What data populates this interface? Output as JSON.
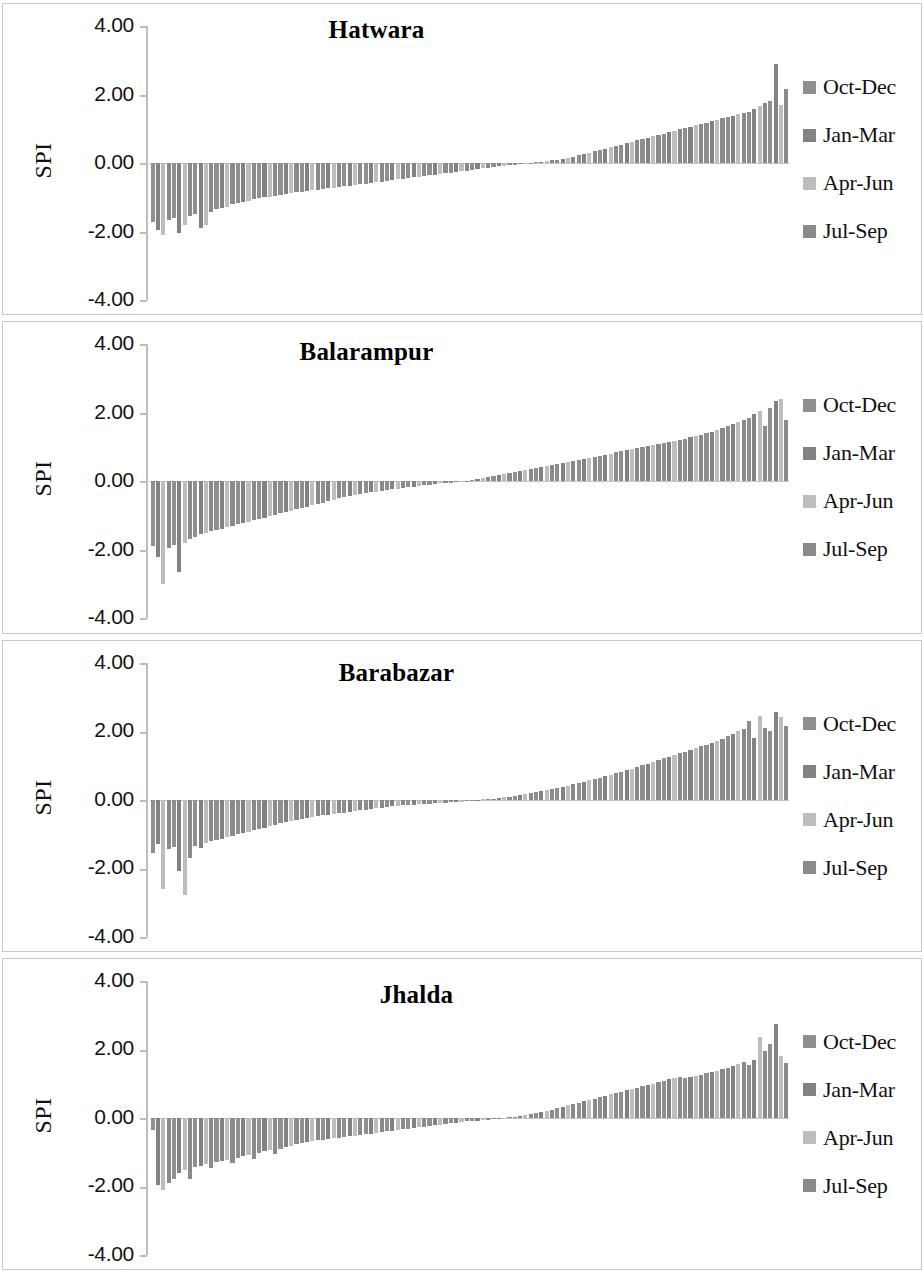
{
  "figure": {
    "background": "#ffffff",
    "panel_border_color": "#c9c9c9",
    "axis_color": "#bdbdbd",
    "panel_count": 4
  },
  "legend": {
    "position": "right",
    "items": [
      {
        "label": "Oct-Dec",
        "color": "#8f8f8f"
      },
      {
        "label": "Jan-Mar",
        "color": "#828282"
      },
      {
        "label": "Apr-Jun",
        "color": "#bdbdbd"
      },
      {
        "label": "Jul-Sep",
        "color": "#8a8a8a"
      }
    ]
  },
  "axis": {
    "ylabel": "SPI",
    "ticks": [
      "4.00",
      "2.00",
      "0.00",
      "-2.00",
      "-4.00"
    ],
    "ymin": -4,
    "ymax": 4
  },
  "chart_data": [
    {
      "type": "bar",
      "title": "Hatwara",
      "xlabel": "",
      "ylabel": "SPI",
      "ylim": [
        -4,
        4
      ],
      "grid": false,
      "legend_position": "right",
      "yticks": [
        4,
        2,
        0,
        -2,
        -4
      ],
      "ytick_labels": [
        "4.00",
        "2.00",
        "0.00",
        "-2.00",
        "-4.00"
      ],
      "series_names": [
        "Oct-Dec",
        "Jan-Mar",
        "Apr-Jun",
        "Jul-Sep"
      ],
      "note": "Sorted SPI values per season, ascending across the x axis",
      "values": [
        -1.72,
        -1.95,
        -2.1,
        -1.66,
        -1.6,
        -2.05,
        -1.82,
        -1.55,
        -1.48,
        -1.9,
        -1.8,
        -1.42,
        -1.35,
        -1.3,
        -1.28,
        -1.2,
        -1.18,
        -1.14,
        -1.1,
        -1.05,
        -1.02,
        -1.0,
        -0.98,
        -0.95,
        -0.93,
        -0.9,
        -0.88,
        -0.86,
        -0.84,
        -0.82,
        -0.8,
        -0.78,
        -0.76,
        -0.74,
        -0.72,
        -0.7,
        -0.68,
        -0.66,
        -0.64,
        -0.62,
        -0.6,
        -0.58,
        -0.56,
        -0.54,
        -0.52,
        -0.5,
        -0.48,
        -0.46,
        -0.44,
        -0.42,
        -0.4,
        -0.38,
        -0.36,
        -0.34,
        -0.32,
        -0.3,
        -0.28,
        -0.26,
        -0.24,
        -0.22,
        -0.2,
        -0.18,
        -0.16,
        -0.14,
        -0.12,
        -0.1,
        -0.08,
        -0.06,
        -0.05,
        -0.04,
        -0.03,
        -0.02,
        0.02,
        0.04,
        0.06,
        0.08,
        0.1,
        0.13,
        0.16,
        0.19,
        0.22,
        0.26,
        0.3,
        0.34,
        0.38,
        0.42,
        0.46,
        0.5,
        0.54,
        0.58,
        0.62,
        0.66,
        0.7,
        0.74,
        0.78,
        0.82,
        0.86,
        0.9,
        0.94,
        0.98,
        1.02,
        1.06,
        1.1,
        1.14,
        1.18,
        1.22,
        1.26,
        1.3,
        1.34,
        1.38,
        1.42,
        1.46,
        1.5,
        1.58,
        1.66,
        1.74,
        1.82,
        2.9,
        1.7,
        2.15
      ]
    },
    {
      "type": "bar",
      "title": "Balarampur",
      "xlabel": "",
      "ylabel": "SPI",
      "ylim": [
        -4,
        4
      ],
      "grid": false,
      "legend_position": "right",
      "yticks": [
        4,
        2,
        0,
        -2,
        -4
      ],
      "ytick_labels": [
        "4.00",
        "2.00",
        "0.00",
        "-2.00",
        "-4.00"
      ],
      "series_names": [
        "Oct-Dec",
        "Jan-Mar",
        "Apr-Jun",
        "Jul-Sep"
      ],
      "note": "Sorted SPI values per season, ascending across the x axis",
      "values": [
        -1.9,
        -2.2,
        -3.0,
        -1.95,
        -1.85,
        -2.65,
        -1.8,
        -1.7,
        -1.62,
        -1.55,
        -1.5,
        -1.45,
        -1.42,
        -1.38,
        -1.34,
        -1.3,
        -1.26,
        -1.22,
        -1.18,
        -1.14,
        -1.1,
        -1.06,
        -1.02,
        -0.98,
        -0.94,
        -0.9,
        -0.86,
        -0.82,
        -0.78,
        -0.74,
        -0.7,
        -0.66,
        -0.62,
        -0.58,
        -0.54,
        -0.5,
        -0.47,
        -0.44,
        -0.41,
        -0.38,
        -0.35,
        -0.32,
        -0.3,
        -0.28,
        -0.26,
        -0.24,
        -0.22,
        -0.2,
        -0.18,
        -0.16,
        -0.14,
        -0.12,
        -0.1,
        -0.08,
        -0.06,
        -0.05,
        -0.04,
        -0.03,
        -0.02,
        -0.01,
        0.03,
        0.06,
        0.09,
        0.12,
        0.15,
        0.18,
        0.21,
        0.24,
        0.27,
        0.3,
        0.33,
        0.36,
        0.39,
        0.42,
        0.45,
        0.48,
        0.51,
        0.54,
        0.57,
        0.6,
        0.63,
        0.66,
        0.69,
        0.72,
        0.75,
        0.78,
        0.81,
        0.84,
        0.87,
        0.9,
        0.93,
        0.96,
        0.99,
        1.02,
        1.05,
        1.08,
        1.11,
        1.14,
        1.17,
        1.2,
        1.24,
        1.28,
        1.32,
        1.36,
        1.4,
        1.45,
        1.5,
        1.55,
        1.6,
        1.66,
        1.72,
        1.78,
        1.85,
        1.95,
        2.05,
        1.6,
        2.15,
        2.35,
        2.4,
        1.8
      ]
    },
    {
      "type": "bar",
      "title": "Barabazar",
      "xlabel": "",
      "ylabel": "SPI",
      "ylim": [
        -4,
        4
      ],
      "grid": false,
      "legend_position": "right",
      "yticks": [
        4,
        2,
        0,
        -2,
        -4
      ],
      "ytick_labels": [
        "4.00",
        "2.00",
        "0.00",
        "-2.00",
        "-4.00"
      ],
      "series_names": [
        "Oct-Dec",
        "Jan-Mar",
        "Apr-Jun",
        "Jul-Sep"
      ],
      "note": "Sorted SPI values per season, ascending across the x axis",
      "values": [
        -1.55,
        -1.3,
        -2.6,
        -1.45,
        -1.38,
        -2.1,
        -2.8,
        -1.7,
        -1.35,
        -1.42,
        -1.28,
        -1.22,
        -1.18,
        -1.14,
        -1.1,
        -1.06,
        -1.02,
        -0.98,
        -0.94,
        -0.9,
        -0.86,
        -0.82,
        -0.78,
        -0.74,
        -0.7,
        -0.67,
        -0.64,
        -0.61,
        -0.58,
        -0.55,
        -0.52,
        -0.49,
        -0.46,
        -0.44,
        -0.42,
        -0.4,
        -0.38,
        -0.36,
        -0.34,
        -0.32,
        -0.3,
        -0.28,
        -0.26,
        -0.24,
        -0.22,
        -0.2,
        -0.18,
        -0.17,
        -0.16,
        -0.15,
        -0.14,
        -0.13,
        -0.12,
        -0.11,
        -0.1,
        -0.09,
        -0.08,
        -0.07,
        -0.06,
        -0.05,
        -0.04,
        -0.03,
        -0.02,
        -0.01,
        0.02,
        0.04,
        0.06,
        0.08,
        0.1,
        0.12,
        0.15,
        0.18,
        0.21,
        0.24,
        0.27,
        0.3,
        0.33,
        0.36,
        0.4,
        0.44,
        0.48,
        0.52,
        0.56,
        0.6,
        0.64,
        0.68,
        0.72,
        0.76,
        0.8,
        0.85,
        0.9,
        0.95,
        1.0,
        1.05,
        1.1,
        1.15,
        1.2,
        1.25,
        1.3,
        1.35,
        1.4,
        1.45,
        1.5,
        1.55,
        1.6,
        1.66,
        1.72,
        1.78,
        1.85,
        1.92,
        1.99,
        2.06,
        2.3,
        1.8,
        2.45,
        2.1,
        2.0,
        2.55,
        2.4,
        2.15
      ]
    },
    {
      "type": "bar",
      "title": "Jhalda",
      "xlabel": "",
      "ylabel": "SPI",
      "ylim": [
        -4,
        4
      ],
      "grid": false,
      "legend_position": "right",
      "yticks": [
        4,
        2,
        0,
        -2,
        -4
      ],
      "ytick_labels": [
        "4.00",
        "2.00",
        "0.00",
        "-2.00",
        "-4.00"
      ],
      "series_names": [
        "Oct-Dec",
        "Jan-Mar",
        "Apr-Jun",
        "Jul-Sep"
      ],
      "note": "Sorted SPI values per season, ascending across the x axis",
      "values": [
        -0.35,
        -1.95,
        -2.1,
        -1.9,
        -1.8,
        -1.6,
        -1.52,
        -1.78,
        -1.45,
        -1.4,
        -1.35,
        -1.48,
        -1.3,
        -1.25,
        -1.22,
        -1.32,
        -1.18,
        -1.12,
        -1.08,
        -1.2,
        -1.02,
        -0.98,
        -0.94,
        -1.05,
        -0.9,
        -0.86,
        -0.82,
        -0.78,
        -0.74,
        -0.7,
        -0.68,
        -0.66,
        -0.64,
        -0.62,
        -0.6,
        -0.58,
        -0.56,
        -0.54,
        -0.52,
        -0.5,
        -0.48,
        -0.46,
        -0.44,
        -0.42,
        -0.4,
        -0.38,
        -0.36,
        -0.34,
        -0.32,
        -0.3,
        -0.28,
        -0.26,
        -0.24,
        -0.22,
        -0.2,
        -0.18,
        -0.16,
        -0.14,
        -0.12,
        -0.1,
        -0.09,
        -0.08,
        -0.07,
        -0.06,
        -0.05,
        -0.04,
        -0.03,
        -0.02,
        0.02,
        0.04,
        0.07,
        0.1,
        0.13,
        0.16,
        0.2,
        0.24,
        0.28,
        0.32,
        0.36,
        0.4,
        0.44,
        0.48,
        0.52,
        0.56,
        0.6,
        0.64,
        0.68,
        0.72,
        0.76,
        0.8,
        0.84,
        0.88,
        0.92,
        0.96,
        1.0,
        1.04,
        1.08,
        1.12,
        1.16,
        1.2,
        1.15,
        1.18,
        1.22,
        1.26,
        1.3,
        1.34,
        1.38,
        1.42,
        1.46,
        1.5,
        1.56,
        1.62,
        1.55,
        1.7,
        2.35,
        1.95,
        2.15,
        2.75,
        1.8,
        1.6
      ]
    }
  ]
}
